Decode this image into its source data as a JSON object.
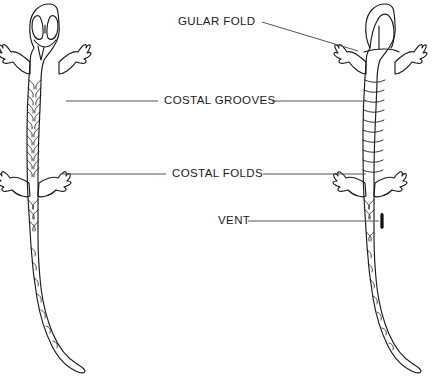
{
  "figure": {
    "background_color": "#ffffff",
    "ink_color": "#1b1b1b",
    "line_color": "#555555",
    "views": [
      {
        "name": "dorsal-view",
        "description": "Left salamander, dorsal (top) view showing head with eyes, costal grooves along sides, four limbs and curved tail"
      },
      {
        "name": "ventral-view",
        "description": "Right salamander, ventral (underside) view showing gular fold at throat, costal folds, vent and curved tail"
      }
    ]
  },
  "labels": [
    {
      "id": "gular-fold",
      "text": "GULAR FOLD",
      "x": 178,
      "y": 22,
      "anchor": "start",
      "leader": "diagonal-right"
    },
    {
      "id": "costal-grooves",
      "text": "COSTAL GROOVES",
      "x": 164,
      "y": 101,
      "anchor": "start",
      "leader": "both-sides"
    },
    {
      "id": "costal-folds",
      "text": "COSTAL FOLDS",
      "x": 172,
      "y": 174,
      "anchor": "start",
      "leader": "both-sides"
    },
    {
      "id": "vent",
      "text": "VENT",
      "x": 218,
      "y": 221,
      "anchor": "start",
      "leader": "right-only"
    }
  ],
  "leader_lines": [
    {
      "id": "gular-fold-leader",
      "x1": 262,
      "y1": 22,
      "x2": 358,
      "y2": 51
    },
    {
      "id": "costal-grooves-leader-left",
      "x1": 66,
      "y1": 101,
      "x2": 158,
      "y2": 101
    },
    {
      "id": "costal-grooves-leader-right",
      "x1": 272,
      "y1": 101,
      "x2": 366,
      "y2": 101
    },
    {
      "id": "costal-folds-leader-left",
      "x1": 62,
      "y1": 174,
      "x2": 166,
      "y2": 174
    },
    {
      "id": "costal-folds-leader-right",
      "x1": 263,
      "y1": 174,
      "x2": 366,
      "y2": 174
    },
    {
      "id": "vent-leader-right",
      "x1": 248,
      "y1": 221,
      "x2": 379,
      "y2": 221
    }
  ],
  "anatomy_marks": {
    "vent": {
      "x": 382,
      "y": 221,
      "width": 2.6,
      "height": 15,
      "color": "#111111"
    }
  }
}
